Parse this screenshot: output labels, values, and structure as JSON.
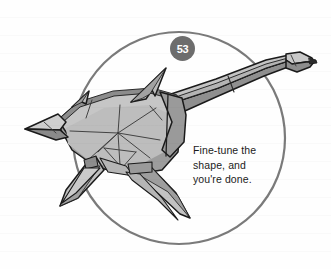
{
  "page": {
    "type": "origami-instruction-step",
    "background_color": "#fefefe"
  },
  "step_badge": {
    "number": "53",
    "fill_color": "#6d6d6d",
    "text_color": "#ffffff"
  },
  "circle_frame": {
    "name": "step-circle-outline",
    "stroke_color": "#7a7a7a",
    "cx": 179,
    "cy": 138,
    "r": 106,
    "stroke_width": 2.2
  },
  "caption": {
    "line1": "Fine-tune the",
    "line2": "shape, and",
    "line3": "you're done.",
    "text_color": "#1b1b1b"
  },
  "illustration": {
    "name": "origami-plesiosaur-diagram",
    "description": "Folded paper long-necked sea creature with four flippers, two dorsal spines and a pointed tail",
    "outline_color": "#1a1a1a",
    "fill_light": "#c8c8c8",
    "fill_mid": "#b0b0b0",
    "fill_dark": "#8f8f8f",
    "fill_shadow": "#7c7c7c",
    "crease_color": "#4a4a4a"
  }
}
